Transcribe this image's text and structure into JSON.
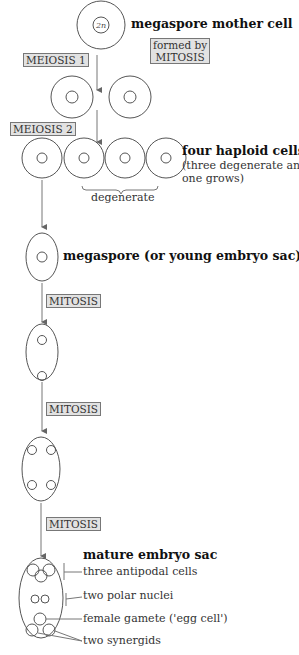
{
  "diagram": {
    "stages": {
      "mother_cell": {
        "label": "megaspore mother cell",
        "nucleus": "2n"
      },
      "formed_by": {
        "line1": "formed by",
        "line2": "MITOSIS"
      },
      "meiosis1": "MEIOSIS 1",
      "meiosis2": "MEIOSIS 2",
      "nucleus_n": "n",
      "four_cells": {
        "title": "four haploid cells",
        "line1": "(three degenerate and",
        "line2": "one grows)"
      },
      "degenerate": "degenerate",
      "megaspore": "megaspore (or young embryo sac)",
      "mitosis": "MITOSIS",
      "mature": {
        "title": "mature embryo sac",
        "parts": [
          "three antipodal cells",
          "two polar nuclei",
          "female gamete ('egg cell')",
          "two synergids"
        ]
      }
    }
  }
}
